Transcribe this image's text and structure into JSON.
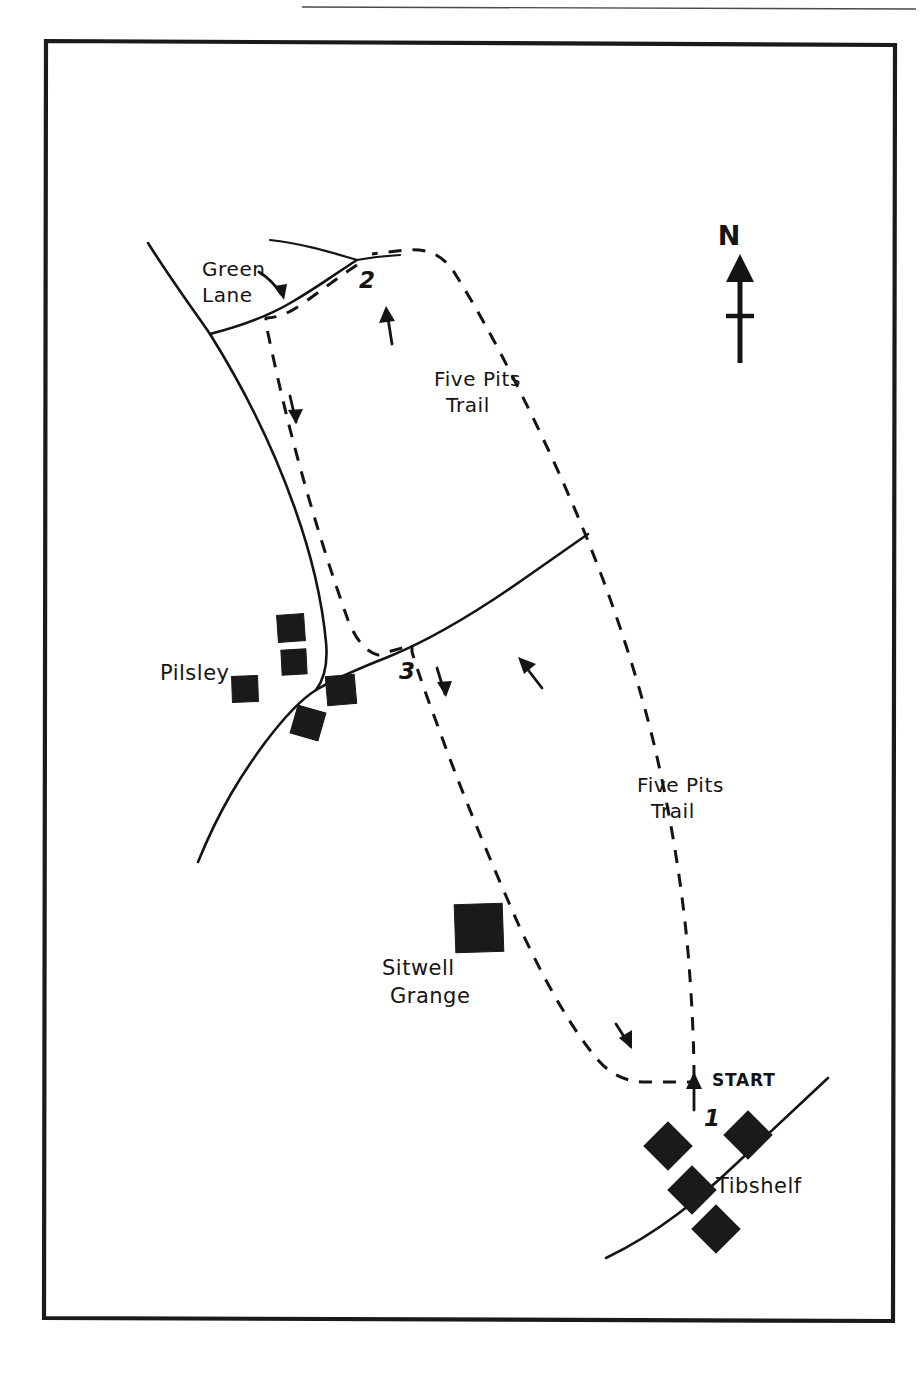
{
  "figure": {
    "kind": "hand-drawn-walking-route-map",
    "background_color": "#ffffff",
    "ink_color": "#141414",
    "frame": {
      "x": 45,
      "y": 40,
      "width": 850,
      "height": 1282
    }
  },
  "compass": {
    "label": "N",
    "name": "north-arrow"
  },
  "place_labels": [
    {
      "id": "pilsley",
      "text": "Pilsley",
      "x": 160,
      "y": 680
    },
    {
      "id": "tibshelf",
      "text": "Tibshelf",
      "x": 716,
      "y": 1193
    },
    {
      "id": "sitwell-grange",
      "text_line_1": "Sitwell",
      "text_line_2": "Grange",
      "x": 382,
      "y": 975
    }
  ],
  "route_labels": [
    {
      "id": "five-pits-trail-north",
      "line_1": "Five Pits",
      "line_2": "Trail",
      "x": 434,
      "y": 386
    },
    {
      "id": "five-pits-trail-south",
      "line_1": "Five Pits",
      "line_2": "Trail",
      "x": 637,
      "y": 792
    }
  ],
  "road_labels": [
    {
      "id": "green-lane",
      "line_1": "Green",
      "line_2": "Lane",
      "x": 202,
      "y": 276
    }
  ],
  "start_marker": {
    "label": "START",
    "x": 712,
    "y": 1086
  },
  "waypoints": [
    {
      "id": "waypoint-1",
      "label": "1",
      "x": 704,
      "y": 1126
    },
    {
      "id": "waypoint-2",
      "label": "2",
      "x": 359,
      "y": 288
    },
    {
      "id": "waypoint-3",
      "label": "3",
      "x": 399,
      "y": 679
    }
  ],
  "buildings": {
    "pilsley": [
      {
        "cx": 291,
        "cy": 628,
        "size": 27,
        "rotate": -4
      },
      {
        "cx": 294,
        "cy": 662,
        "size": 25,
        "rotate": -3
      },
      {
        "cx": 245,
        "cy": 689,
        "size": 26,
        "rotate": -2
      },
      {
        "cx": 341,
        "cy": 690,
        "size": 29,
        "rotate": -5
      },
      {
        "cx": 308,
        "cy": 723,
        "size": 29,
        "rotate": 16
      }
    ],
    "sitwell_grange": [
      {
        "cx": 479,
        "cy": 928,
        "size": 48,
        "rotate": -2
      }
    ],
    "tibshelf": [
      {
        "cx": 668,
        "cy": 1146,
        "size": 34,
        "rotate": 45
      },
      {
        "cx": 748,
        "cy": 1135,
        "size": 34,
        "rotate": 45
      },
      {
        "cx": 692,
        "cy": 1190,
        "size": 34,
        "rotate": 45
      },
      {
        "cx": 716,
        "cy": 1229,
        "size": 34,
        "rotate": 45
      }
    ]
  },
  "roads": [
    {
      "id": "main-road-pilsley",
      "description": "road curving from upper-left down through Pilsley to lower-left"
    },
    {
      "id": "green-lane",
      "description": "lane running east from junction up to top road"
    },
    {
      "id": "top-road",
      "description": "road crossing near the top of the map"
    },
    {
      "id": "pilsley-tibshelf-road",
      "description": "road running from Pilsley north-east across the trail"
    },
    {
      "id": "tibshelf-road",
      "description": "road running north-east to south-west through Tibshelf"
    }
  ],
  "trail": {
    "name": "Five Pits Trail",
    "style": "dashed",
    "description": "circular dashed walking route from START north to waypoint 2 and back"
  }
}
